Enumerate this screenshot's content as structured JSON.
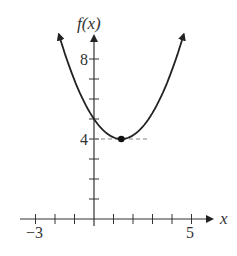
{
  "chart_data": {
    "type": "line",
    "title": "",
    "xlabel": "x",
    "ylabel": "f(x)",
    "x_tick_labels": [
      {
        "value": -3,
        "label": "−3"
      },
      {
        "value": 5,
        "label": "5"
      }
    ],
    "y_tick_labels": [
      {
        "value": 4,
        "label": "4"
      },
      {
        "value": 8,
        "label": "8"
      }
    ],
    "x_ticks": [
      -3,
      -2,
      -1,
      1,
      2,
      3,
      4,
      5
    ],
    "y_ticks": [
      1,
      2,
      3,
      4,
      5,
      6,
      7,
      8
    ],
    "xlim": [
      -3,
      6
    ],
    "ylim": [
      0,
      9
    ],
    "grid": false,
    "series": [
      {
        "name": "f(x)",
        "description": "upward-opening parabola with arrows at both ends",
        "vertex": {
          "x": 1.4,
          "y": 4
        },
        "y_intercept": 5,
        "x": [
          -1.8,
          -1,
          0,
          1,
          1.4,
          2,
          3,
          4,
          4.6
        ],
        "y": [
          9.2,
          6.9,
          5.0,
          4.1,
          4.0,
          4.2,
          5.3,
          7.4,
          9.2
        ]
      }
    ],
    "annotations": [
      {
        "type": "point",
        "x": 1.4,
        "y": 4,
        "description": "filled dot at minimum"
      },
      {
        "type": "dashed-line",
        "from": {
          "x": 0,
          "y": 4
        },
        "to": {
          "x": 2.8,
          "y": 4
        }
      }
    ]
  },
  "labels": {
    "y_axis": "f(x)",
    "x_axis": "x",
    "y8": "8",
    "y4": "4",
    "xneg3": "−3",
    "x5": "5"
  }
}
